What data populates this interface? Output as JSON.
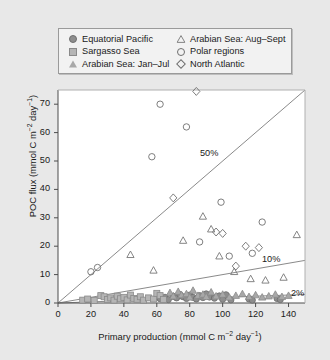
{
  "legend": {
    "entries": [
      {
        "label": "Equatorial Pacific",
        "marker": "circle-filled",
        "column": "left"
      },
      {
        "label": "Sargasso Sea",
        "marker": "square-filled",
        "column": "left"
      },
      {
        "label": "Arabian Sea: Jan–Jul",
        "marker": "triangle-filled",
        "column": "left"
      },
      {
        "label": "Arabian Sea: Aug–Sept",
        "marker": "triangle-open",
        "column": "right"
      },
      {
        "label": "Polar regions",
        "marker": "circle-open",
        "column": "right"
      },
      {
        "label": "North Atlantic",
        "marker": "diamond-open",
        "column": "right"
      }
    ]
  },
  "annotations": {
    "pct50": "50%",
    "pct10": "10%",
    "pct2": "2%"
  },
  "colors": {
    "background": "#e8e8e8",
    "plot_background": "#ffffff",
    "axis": "#4d4d4d",
    "reference_line": "#8a8a8a",
    "filled_marker": "#9a9a9a",
    "open_marker": "#6f6f6f"
  },
  "chart_data": {
    "type": "scatter",
    "title": "",
    "xlabel": "Primary production (mmol C m⁻² day⁻¹)",
    "ylabel": "POC flux (mmol C m⁻² day⁻¹)",
    "xlim": [
      0,
      150
    ],
    "ylim": [
      0,
      75
    ],
    "xticks": [
      0,
      20,
      40,
      60,
      80,
      100,
      120,
      140
    ],
    "yticks": [
      0,
      10,
      20,
      30,
      40,
      50,
      60,
      70
    ],
    "xtick_labels": [
      "0",
      "20",
      "40",
      "60",
      "80",
      "100",
      "120",
      "140"
    ],
    "ytick_labels": [
      "0",
      "10",
      "20",
      "30",
      "40",
      "50",
      "60",
      "70"
    ],
    "grid": false,
    "legend_position": "above-axes",
    "reference_lines": [
      {
        "label": "50%",
        "slope": 0.5,
        "intercept": 0
      },
      {
        "label": "10%",
        "slope": 0.1,
        "intercept": 0
      },
      {
        "label": "2%",
        "slope": 0.02,
        "intercept": 0
      }
    ],
    "series": [
      {
        "name": "Equatorial Pacific",
        "marker": "circle-filled",
        "points": [
          [
            62,
            1.5
          ],
          [
            65,
            2.0
          ],
          [
            67,
            1.2
          ],
          [
            70,
            2.4
          ],
          [
            72,
            1.8
          ],
          [
            74,
            3.0
          ],
          [
            76,
            2.2
          ],
          [
            78,
            1.6
          ],
          [
            80,
            2.8
          ],
          [
            82,
            2.0
          ],
          [
            84,
            1.4
          ],
          [
            86,
            2.6
          ],
          [
            88,
            1.9
          ],
          [
            90,
            3.2
          ],
          [
            92,
            2.1
          ],
          [
            95,
            1.7
          ],
          [
            98,
            2.5
          ],
          [
            100,
            1.3
          ],
          [
            102,
            2.9
          ],
          [
            105,
            1.1
          ],
          [
            116,
            1.4
          ],
          [
            118,
            1.0
          ],
          [
            133,
            1.6
          ],
          [
            135,
            1.2
          ]
        ]
      },
      {
        "name": "Sargasso Sea",
        "marker": "square-filled",
        "points": [
          [
            15,
            1.0
          ],
          [
            18,
            1.4
          ],
          [
            22,
            0.9
          ],
          [
            26,
            2.6
          ],
          [
            28,
            2.2
          ],
          [
            30,
            1.2
          ],
          [
            32,
            1.8
          ],
          [
            34,
            1.0
          ],
          [
            36,
            2.4
          ],
          [
            38,
            1.5
          ],
          [
            40,
            2.0
          ],
          [
            42,
            1.1
          ],
          [
            44,
            2.8
          ],
          [
            46,
            1.6
          ],
          [
            48,
            1.3
          ],
          [
            50,
            2.2
          ],
          [
            52,
            1.0
          ],
          [
            55,
            1.8
          ],
          [
            58,
            1.4
          ],
          [
            60,
            3.4
          ],
          [
            62,
            2.6
          ],
          [
            64,
            1.2
          ]
        ]
      },
      {
        "name": "Arabian Sea: Jan–Jul",
        "marker": "triangle-filled",
        "points": [
          [
            68,
            3.6
          ],
          [
            70,
            2.4
          ],
          [
            73,
            4.0
          ],
          [
            75,
            2.8
          ],
          [
            78,
            3.2
          ],
          [
            80,
            2.0
          ],
          [
            82,
            4.4
          ],
          [
            85,
            2.6
          ],
          [
            88,
            3.0
          ],
          [
            90,
            2.2
          ],
          [
            93,
            3.8
          ],
          [
            96,
            2.4
          ],
          [
            100,
            3.0
          ],
          [
            104,
            2.0
          ],
          [
            108,
            2.6
          ],
          [
            112,
            3.2
          ],
          [
            116,
            2.2
          ],
          [
            120,
            2.8
          ],
          [
            124,
            2.0
          ],
          [
            128,
            2.4
          ],
          [
            132,
            3.0
          ],
          [
            136,
            2.2
          ],
          [
            140,
            2.6
          ]
        ]
      },
      {
        "name": "Arabian Sea: Aug–Sept",
        "marker": "triangle-open",
        "points": [
          [
            44,
            17.0
          ],
          [
            58,
            11.5
          ],
          [
            76,
            22.0
          ],
          [
            88,
            30.5
          ],
          [
            93,
            26.0
          ],
          [
            98,
            16.5
          ],
          [
            107,
            11.0
          ],
          [
            117,
            8.5
          ],
          [
            126,
            8.0
          ],
          [
            137,
            9.0
          ],
          [
            145,
            24.0
          ]
        ]
      },
      {
        "name": "Polar regions",
        "marker": "circle-open",
        "points": [
          [
            20,
            11.0
          ],
          [
            24,
            12.5
          ],
          [
            57,
            51.5
          ],
          [
            62,
            70.0
          ],
          [
            78,
            62.0
          ],
          [
            86,
            21.5
          ],
          [
            99,
            35.5
          ],
          [
            104,
            16.5
          ],
          [
            118,
            17.5
          ],
          [
            124,
            28.5
          ]
        ]
      },
      {
        "name": "North Atlantic",
        "marker": "diamond-open",
        "points": [
          [
            84,
            74.5
          ],
          [
            70,
            37.0
          ],
          [
            96,
            25.0
          ],
          [
            100,
            24.5
          ],
          [
            108,
            13.0
          ],
          [
            114,
            20.0
          ],
          [
            122,
            19.5
          ]
        ]
      }
    ]
  }
}
